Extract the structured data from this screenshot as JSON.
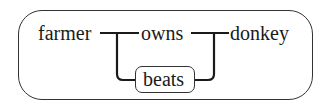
{
  "diagram": {
    "nodes": {
      "farmer": "farmer",
      "owns": "owns",
      "donkey": "donkey",
      "beats": "beats"
    },
    "edges": [
      {
        "from": "farmer",
        "to": "owns"
      },
      {
        "from": "farmer",
        "to": "beats"
      },
      {
        "from": "owns",
        "to": "donkey"
      },
      {
        "from": "beats",
        "to": "donkey"
      }
    ],
    "colors": {
      "stroke": "#1a1a1a",
      "text": "#1a1a1a",
      "background": "#ffffff"
    }
  }
}
